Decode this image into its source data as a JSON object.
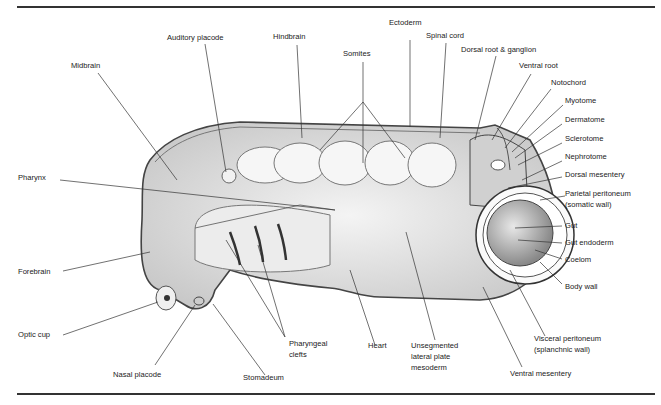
{
  "figure": {
    "labels": {
      "midbrain": "Midbrain",
      "auditory_placode": "Auditory placode",
      "hindbrain": "Hindbrain",
      "somites": "Somites",
      "ectoderm": "Ectoderm",
      "spinal_cord": "Spinal cord",
      "dorsal_root": "Dorsal root & ganglion",
      "ventral_root": "Ventral root",
      "notochord": "Notochord",
      "myotome": "Myotome",
      "dermatome": "Dermatome",
      "sclerotome": "Sclerotome",
      "nephrotome": "Nephrotome",
      "dorsal_mesentery": "Dorsal mesentery",
      "parietal_peritoneum_1": "Parietal peritoneum",
      "parietal_peritoneum_2": "(somatic wall)",
      "gut": "Gut",
      "gut_endoderm": "Gut endoderm",
      "coelom": "Coelom",
      "body_wall": "Body wall",
      "pharynx": "Pharynx",
      "forebrain": "Forebrain",
      "optic_cup": "Optic cup",
      "nasal_placode": "Nasal placode",
      "stomadeum": "Stomadeum",
      "pharyngeal_clefts_1": "Pharyngeal",
      "pharyngeal_clefts_2": "clefts",
      "heart": "Heart",
      "lateral_plate_1": "Unsegmented",
      "lateral_plate_2": "lateral plate",
      "lateral_plate_3": "mesoderm",
      "visceral_peritoneum_1": "Visceral peritoneum",
      "visceral_peritoneum_2": "(splanchnic wall)",
      "ventral_mesentery": "Ventral mesentery"
    }
  }
}
